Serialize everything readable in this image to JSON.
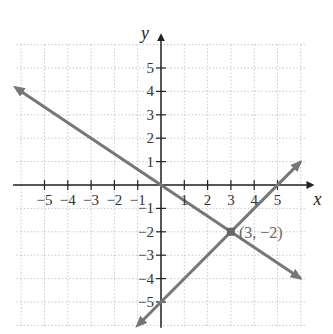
{
  "chart_data": {
    "type": "line",
    "title": "",
    "xlabel": "x",
    "ylabel": "y",
    "xlim": [
      -6,
      6
    ],
    "ylim": [
      -6,
      6
    ],
    "grid": true,
    "x_ticks": [
      -5,
      -4,
      -3,
      -2,
      -1,
      1,
      2,
      3,
      4,
      5
    ],
    "y_ticks": [
      5,
      4,
      3,
      2,
      1,
      -1,
      -2,
      -3,
      -4,
      -5
    ],
    "x_tick_labels": [
      "−5",
      "−4",
      "−3",
      "−2",
      "−1",
      "1",
      "2",
      "3",
      "4",
      "5"
    ],
    "y_tick_labels": [
      "5",
      "4",
      "3",
      "2",
      "1",
      "−1",
      "−2",
      "−3",
      "−4",
      "−5"
    ],
    "series": [
      {
        "name": "y = -2/3 x",
        "slope": -0.6667,
        "intercept": 0,
        "x": [
          -6,
          6
        ],
        "y": [
          4,
          -4
        ],
        "color": "#777777"
      },
      {
        "name": "y = x - 5",
        "slope": 1,
        "intercept": -5,
        "x": [
          -0.8,
          6
        ],
        "y": [
          -5.8,
          1
        ],
        "color": "#777777"
      }
    ],
    "annotations": [
      {
        "text": "(3, −2)",
        "x": 3,
        "y": -2,
        "marker": "square"
      }
    ]
  },
  "labels": {
    "x_axis": "x",
    "y_axis": "y",
    "intersection": "(3, −2)"
  }
}
